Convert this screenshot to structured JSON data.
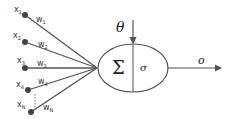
{
  "diagram": {
    "inputs": [
      {
        "label": "x",
        "sub": "1",
        "weight": "w",
        "wsub": "1",
        "node": [
          25,
          15
        ],
        "lx": 14,
        "ly": 12,
        "wx": 36,
        "wy": 22
      },
      {
        "label": "x",
        "sub": "2",
        "weight": "w",
        "wsub": "2",
        "node": [
          25,
          42
        ],
        "lx": 13,
        "ly": 38,
        "wx": 38,
        "wy": 47
      },
      {
        "label": "x",
        "sub": "3",
        "weight": "w",
        "wsub": "3",
        "node": [
          25,
          68
        ],
        "lx": 17,
        "ly": 63,
        "wx": 37,
        "wy": 66
      },
      {
        "label": "x",
        "sub": "4",
        "weight": "w",
        "wsub": "4",
        "node": [
          28,
          90
        ],
        "lx": 16,
        "ly": 87,
        "wx": 38,
        "wy": 84
      },
      {
        "label": "x",
        "sub": "N",
        "weight": "w",
        "wsub": "N",
        "node": [
          31,
          112
        ],
        "lx": 17,
        "ly": 107,
        "wx": 43,
        "wy": 110
      }
    ],
    "bias_label": "θ",
    "sum_symbol": "Σ",
    "activation_symbol": "σ",
    "output_label": "o",
    "colors": {
      "line": "#555555",
      "node": "#444444",
      "text": "#333333"
    }
  }
}
